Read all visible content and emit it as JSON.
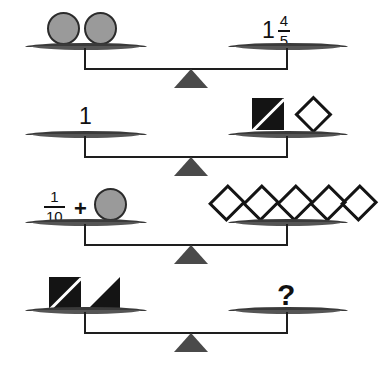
{
  "puzzle": {
    "type": "balance-scale-fraction-puzzle",
    "background_color": "#ffffff",
    "ink_color": "#141414",
    "pan_color": "#3a3a3a",
    "fulcrum_color": "#4a4a4a",
    "circle_fill_color": "#9a9a9a",
    "circle_stroke_color": "#2b2b2b"
  },
  "rows": [
    {
      "id": "row-1",
      "left": {
        "description": "two gray circles",
        "items": [
          {
            "kind": "circle",
            "label": "circle"
          },
          {
            "kind": "circle",
            "label": "circle"
          }
        ]
      },
      "right": {
        "description": "mixed number one and four fifths",
        "items": [
          {
            "kind": "mixed-number",
            "whole": "1",
            "numerator": "4",
            "denominator": "5"
          }
        ]
      }
    },
    {
      "id": "row-2",
      "left": {
        "description": "the number one",
        "items": [
          {
            "kind": "number",
            "value": "1"
          }
        ]
      },
      "right": {
        "description": "black square with white diagonal and an open diamond",
        "items": [
          {
            "kind": "square-diagonal",
            "label": "black-square-with-diagonal"
          },
          {
            "kind": "diamond",
            "label": "diamond"
          }
        ]
      }
    },
    {
      "id": "row-3",
      "left": {
        "description": "one tenth plus a gray circle",
        "items": [
          {
            "kind": "fraction",
            "numerator": "1",
            "denominator": "10"
          },
          {
            "kind": "operator",
            "value": "+"
          },
          {
            "kind": "circle",
            "label": "circle"
          }
        ]
      },
      "right": {
        "description": "five open diamonds",
        "items": [
          {
            "kind": "diamond",
            "label": "diamond"
          },
          {
            "kind": "diamond",
            "label": "diamond"
          },
          {
            "kind": "diamond",
            "label": "diamond"
          },
          {
            "kind": "diamond",
            "label": "diamond"
          },
          {
            "kind": "diamond",
            "label": "diamond"
          }
        ]
      }
    },
    {
      "id": "row-4",
      "left": {
        "description": "black square with white diagonal and a black triangle",
        "items": [
          {
            "kind": "square-diagonal",
            "label": "black-square-with-diagonal"
          },
          {
            "kind": "triangle",
            "label": "black-triangle"
          }
        ]
      },
      "right": {
        "description": "unknown value",
        "items": [
          {
            "kind": "question",
            "value": "?"
          }
        ]
      }
    }
  ],
  "labels": {
    "row1_right_whole": "1",
    "row1_right_num": "4",
    "row1_right_den": "5",
    "row2_left_number": "1",
    "row3_left_num": "1",
    "row3_left_den": "10",
    "row3_left_operator": "+",
    "row4_right_question": "?"
  }
}
